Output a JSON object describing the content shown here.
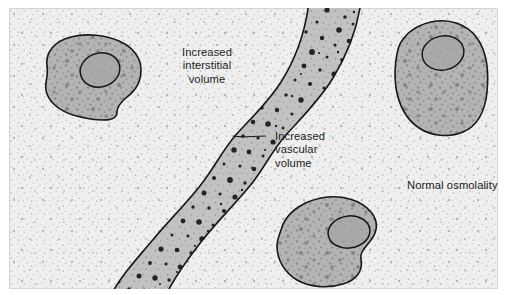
{
  "figure": {
    "panel": {
      "background_color": "#efefef",
      "border_color": "#d2d2d2",
      "stipple_color": "#b9b9c2"
    },
    "labels": [
      {
        "id": "interstitial",
        "name": "label-increased-interstitial-volume",
        "lines": [
          "Increased",
          "interstitial",
          "volume"
        ],
        "text": "Increased\ninterstitial\nvolume",
        "align": "center",
        "color": "#1c1c1c"
      },
      {
        "id": "vascular",
        "name": "label-increased-vascular-volume",
        "lines": [
          "Increased",
          "vascular",
          "volume"
        ],
        "text": "Increased\nvascular\nvolume",
        "align": "left",
        "color": "#1c1c1c",
        "leader_line": true
      },
      {
        "id": "osmolality",
        "name": "label-normal-osmolality",
        "lines": [
          "Normal osmolality"
        ],
        "text": "Normal osmolality",
        "align": "left",
        "color": "#1c1c1c"
      }
    ],
    "vessel": {
      "name": "blood-vessel",
      "description": "Wavy vascular channel running from top center to bottom left",
      "fill_color": "#c0c0c0",
      "outline_color": "#1a1a1a",
      "particle_color": "#242424",
      "particle_count": 96
    },
    "cells": [
      {
        "id": "cell-top-left",
        "name": "cell-top-left",
        "fill_color": "#b3b3b3",
        "outline_color": "#1a1a1a",
        "nucleus_fill": "#a8a8a8",
        "nucleus_outline": "#1a1a1a"
      },
      {
        "id": "cell-top-right",
        "name": "cell-top-right",
        "fill_color": "#b3b3b3",
        "outline_color": "#1a1a1a",
        "nucleus_fill": "#a8a8a8",
        "nucleus_outline": "#1a1a1a"
      },
      {
        "id": "cell-bottom-center",
        "name": "cell-bottom-center",
        "fill_color": "#b3b3b3",
        "outline_color": "#1a1a1a",
        "nucleus_fill": "#a8a8a8",
        "nucleus_outline": "#1a1a1a"
      }
    ]
  }
}
